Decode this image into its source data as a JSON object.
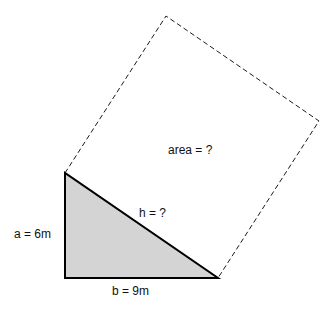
{
  "diagram": {
    "labels": {
      "side_a": "a = 6m",
      "side_b": "b = 9m",
      "hypotenuse": "h = ?",
      "square_area": "area = ?"
    },
    "colors": {
      "triangle_fill": "#d4d4d4",
      "stroke": "#000000"
    }
  }
}
